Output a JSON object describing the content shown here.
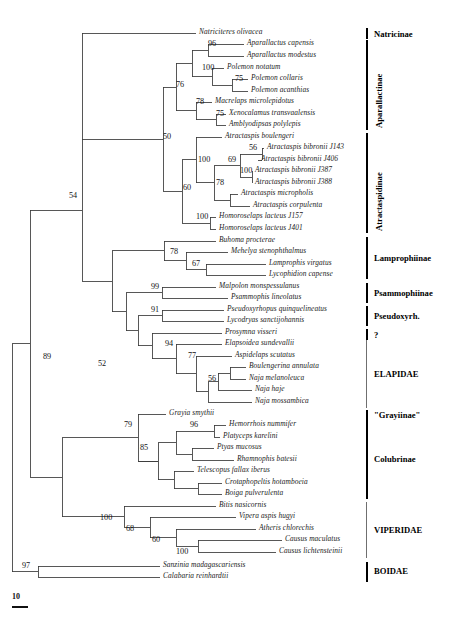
{
  "figure": {
    "line_color": "#3a3a3a",
    "label_color": "#1b1b1b"
  },
  "scale": {
    "value": "10",
    "bar_width_px": 16
  },
  "chart_data": {
    "type": "tree",
    "title": "",
    "xlabel": "",
    "ylabel": "",
    "tip_count": 45,
    "taxa": [
      {
        "id": 0,
        "label": "Natriciteres olivacea",
        "y": 33,
        "x_tip": 196,
        "clade": "Natricinae"
      },
      {
        "id": 1,
        "label": "Aparallactus capensis",
        "y": 44,
        "x_tip": 244,
        "clade": "Aparallactinae"
      },
      {
        "id": 2,
        "label": "Aparallactus modestus",
        "y": 56,
        "x_tip": 244,
        "clade": "Aparallactinae"
      },
      {
        "id": 3,
        "label": "Polemon notatum",
        "y": 68,
        "x_tip": 224,
        "clade": "Aparallactinae"
      },
      {
        "id": 4,
        "label": "Polemon collaris",
        "y": 79,
        "x_tip": 248,
        "clade": "Aparallactinae"
      },
      {
        "id": 5,
        "label": "Polemon acanthias",
        "y": 91,
        "x_tip": 248,
        "clade": "Aparallactinae"
      },
      {
        "id": 6,
        "label": "Macrelaps microlepidotus",
        "y": 102,
        "x_tip": 212,
        "clade": "Aparallactinae"
      },
      {
        "id": 7,
        "label": "Xenocalamus transvaalensis",
        "y": 114,
        "x_tip": 226,
        "clade": "Aparallactinae"
      },
      {
        "id": 8,
        "label": "Amblyodipsas polylepis",
        "y": 125,
        "x_tip": 226,
        "clade": "Aparallactinae"
      },
      {
        "id": 9,
        "label": "Atractaspis boulengeri",
        "y": 137,
        "x_tip": 222,
        "clade": "Atractaspidinae"
      },
      {
        "id": 10,
        "label": "Atractaspis bibronii J143",
        "y": 148,
        "x_tip": 264,
        "clade": "Atractaspidinae"
      },
      {
        "id": 11,
        "label": "Atractaspis bibronii J406",
        "y": 160,
        "x_tip": 258,
        "clade": "Atractaspidinae"
      },
      {
        "id": 12,
        "label": "Atractaspis bibronii J387",
        "y": 171,
        "x_tip": 252,
        "clade": "Atractaspidinae"
      },
      {
        "id": 13,
        "label": "Atractaspis bibronii J388",
        "y": 183,
        "x_tip": 252,
        "clade": "Atractaspidinae"
      },
      {
        "id": 14,
        "label": "Atractaspis micropholis",
        "y": 194,
        "x_tip": 238,
        "clade": "Atractaspidinae"
      },
      {
        "id": 15,
        "label": "Atractaspis corpulenta",
        "y": 206,
        "x_tip": 250,
        "clade": "Atractaspidinae"
      },
      {
        "id": 16,
        "label": "Homoroselaps lacteus J157",
        "y": 217,
        "x_tip": 216,
        "clade": "Atractaspidinae"
      },
      {
        "id": 17,
        "label": "Homoroselaps lacteus J401",
        "y": 229,
        "x_tip": 216,
        "clade": "Atractaspidinae"
      },
      {
        "id": 18,
        "label": "Buhoma procterae",
        "y": 241,
        "x_tip": 216,
        "clade": "Lamprophiinae"
      },
      {
        "id": 19,
        "label": "Mehelya stenophthalmus",
        "y": 252,
        "x_tip": 228,
        "clade": "Lamprophiinae"
      },
      {
        "id": 20,
        "label": "Lamprophis virgatus",
        "y": 264,
        "x_tip": 266,
        "clade": "Lamprophiinae"
      },
      {
        "id": 21,
        "label": "Lycophidion capense",
        "y": 275,
        "x_tip": 266,
        "clade": "Lamprophiinae"
      },
      {
        "id": 22,
        "label": "Malpolon monspessulanus",
        "y": 287,
        "x_tip": 216,
        "clade": "Psammophiinae"
      },
      {
        "id": 23,
        "label": "Psammophis lineolatus",
        "y": 298,
        "x_tip": 228,
        "clade": "Psammophiinae"
      },
      {
        "id": 24,
        "label": "Pseudoxyrhopus quinquelineatus",
        "y": 310,
        "x_tip": 224,
        "clade": "Pseudoxyrh."
      },
      {
        "id": 25,
        "label": "Lycodryas sanctijohannis",
        "y": 321,
        "x_tip": 224,
        "clade": "Pseudoxyrh."
      },
      {
        "id": 26,
        "label": "Prosymna visseri",
        "y": 333,
        "x_tip": 222,
        "clade": "?"
      },
      {
        "id": 27,
        "label": "Elapsoidea sundevallii",
        "y": 344,
        "x_tip": 222,
        "clade": "ELAPIDAE"
      },
      {
        "id": 28,
        "label": "Aspidelaps scutatus",
        "y": 356,
        "x_tip": 232,
        "clade": "ELAPIDAE"
      },
      {
        "id": 29,
        "label": "Boulengerina annulata",
        "y": 367,
        "x_tip": 246,
        "clade": "ELAPIDAE"
      },
      {
        "id": 30,
        "label": "Naja melanoleuca",
        "y": 379,
        "x_tip": 246,
        "clade": "ELAPIDAE"
      },
      {
        "id": 31,
        "label": "Naja haje",
        "y": 390,
        "x_tip": 252,
        "clade": "ELAPIDAE"
      },
      {
        "id": 32,
        "label": "Naja mossambica",
        "y": 402,
        "x_tip": 252,
        "clade": "ELAPIDAE"
      },
      {
        "id": 33,
        "label": "Grayia smythii",
        "y": 414,
        "x_tip": 166,
        "clade": "\"Grayiinae\""
      },
      {
        "id": 34,
        "label": "Hemorrhois nummifer",
        "y": 425,
        "x_tip": 226,
        "clade": "Colubrinae"
      },
      {
        "id": 35,
        "label": "Platyceps karelini",
        "y": 437,
        "x_tip": 220,
        "clade": "Colubrinae"
      },
      {
        "id": 36,
        "label": "Ptyas mucosus",
        "y": 448,
        "x_tip": 214,
        "clade": "Colubrinae"
      },
      {
        "id": 37,
        "label": "Rhamnophis batesii",
        "y": 460,
        "x_tip": 234,
        "clade": "Colubrinae"
      },
      {
        "id": 38,
        "label": "Telescopus fallax iberus",
        "y": 471,
        "x_tip": 194,
        "clade": "Colubrinae"
      },
      {
        "id": 39,
        "label": "Crotaphopeltis hotamboeia",
        "y": 483,
        "x_tip": 222,
        "clade": "Colubrinae"
      },
      {
        "id": 40,
        "label": "Boiga pulverulenta",
        "y": 494,
        "x_tip": 222,
        "clade": "Colubrinae"
      },
      {
        "id": 41,
        "label": "Bitis nasicornis",
        "y": 506,
        "x_tip": 216,
        "clade": "VIPERIDAE"
      },
      {
        "id": 42,
        "label": "Vipera aspis hugyi",
        "y": 517,
        "x_tip": 236,
        "clade": "VIPERIDAE"
      },
      {
        "id": 43,
        "label": "Atheris chlorechis",
        "y": 529,
        "x_tip": 256,
        "clade": "VIPERIDAE"
      },
      {
        "id": 44,
        "label": "Causus maculatus",
        "y": 540,
        "x_tip": 282,
        "clade": "VIPERIDAE"
      },
      {
        "id": 45,
        "label": "Causus lichtensteinii",
        "y": 552,
        "x_tip": 276,
        "clade": "VIPERIDAE"
      },
      {
        "id": 46,
        "label": "Sanzinia madagascariensis",
        "y": 566,
        "x_tip": 160,
        "clade": "BOIDAE"
      },
      {
        "id": 47,
        "label": "Calabaria reinhardtii",
        "y": 577,
        "x_tip": 160,
        "clade": "BOIDAE"
      }
    ],
    "support_values": [
      {
        "value": "96",
        "x": 208,
        "y": 40
      },
      {
        "value": "100",
        "x": 202,
        "y": 64
      },
      {
        "value": "75",
        "x": 235,
        "y": 75
      },
      {
        "value": "76",
        "x": 176,
        "y": 81
      },
      {
        "value": "78",
        "x": 196,
        "y": 98
      },
      {
        "value": "75",
        "x": 216,
        "y": 110
      },
      {
        "value": "50",
        "x": 163,
        "y": 133
      },
      {
        "value": "56",
        "x": 249,
        "y": 144
      },
      {
        "value": "100",
        "x": 198,
        "y": 156
      },
      {
        "value": "69",
        "x": 228,
        "y": 156
      },
      {
        "value": "100",
        "x": 240,
        "y": 167
      },
      {
        "value": "78",
        "x": 216,
        "y": 179
      },
      {
        "value": "60",
        "x": 183,
        "y": 184
      },
      {
        "value": "100",
        "x": 196,
        "y": 213
      },
      {
        "value": "54",
        "x": 69,
        "y": 192
      },
      {
        "value": "78",
        "x": 170,
        "y": 248
      },
      {
        "value": "67",
        "x": 192,
        "y": 260
      },
      {
        "value": "99",
        "x": 151,
        "y": 283
      },
      {
        "value": "91",
        "x": 151,
        "y": 306
      },
      {
        "value": "89",
        "x": 43,
        "y": 353
      },
      {
        "value": "52",
        "x": 98,
        "y": 360
      },
      {
        "value": "94",
        "x": 165,
        "y": 340
      },
      {
        "value": "77",
        "x": 188,
        "y": 352
      },
      {
        "value": "56",
        "x": 208,
        "y": 375
      },
      {
        "value": "79",
        "x": 124,
        "y": 421
      },
      {
        "value": "96",
        "x": 190,
        "y": 421
      },
      {
        "value": "85",
        "x": 140,
        "y": 444
      },
      {
        "value": "100",
        "x": 100,
        "y": 514
      },
      {
        "value": "68",
        "x": 126,
        "y": 525
      },
      {
        "value": "60",
        "x": 152,
        "y": 536
      },
      {
        "value": "100",
        "x": 176,
        "y": 548
      },
      {
        "value": "97",
        "x": 22,
        "y": 562
      }
    ],
    "clade_bars": [
      {
        "label": "Natricinae",
        "top": 28,
        "height": 11,
        "orientation": "horizontal",
        "text_x": 374,
        "text_y": 29,
        "weight": "thick"
      },
      {
        "label": "Aparallactinae",
        "top": 40,
        "height": 90,
        "orientation": "vertical",
        "text_x": 374,
        "text_y": 128,
        "weight": "thick"
      },
      {
        "label": "Atractaspidinae",
        "top": 133,
        "height": 100,
        "orientation": "vertical",
        "text_x": 374,
        "text_y": 231,
        "weight": "thick"
      },
      {
        "label": "Lamprophiinae",
        "top": 237,
        "height": 42,
        "orientation": "horizontal",
        "text_x": 374,
        "text_y": 253,
        "weight": "thick"
      },
      {
        "label": "Psammophiinae",
        "top": 283,
        "height": 20,
        "orientation": "horizontal",
        "text_x": 374,
        "text_y": 288,
        "weight": "thick"
      },
      {
        "label": "Pseudoxyrh.",
        "top": 306,
        "height": 20,
        "orientation": "horizontal",
        "text_x": 374,
        "text_y": 311,
        "weight": "thick"
      },
      {
        "label": "?",
        "top": 329,
        "height": 11,
        "orientation": "horizontal",
        "text_x": 374,
        "text_y": 330,
        "weight": "thick"
      },
      {
        "label": "ELAPIDAE",
        "top": 340,
        "height": 68,
        "orientation": "horizontal",
        "text_x": 374,
        "text_y": 369,
        "weight": "thin"
      },
      {
        "label": "\"Grayiinae\"",
        "top": 410,
        "height": 11,
        "orientation": "horizontal",
        "text_x": 374,
        "text_y": 410,
        "weight": "thick"
      },
      {
        "label": "Colubrinae",
        "top": 421,
        "height": 78,
        "orientation": "horizontal",
        "text_x": 374,
        "text_y": 454,
        "weight": "thick"
      },
      {
        "label": "VIPERIDAE",
        "top": 502,
        "height": 56,
        "orientation": "horizontal",
        "text_x": 374,
        "text_y": 525,
        "weight": "thin"
      },
      {
        "label": "BOIDAE",
        "top": 562,
        "height": 20,
        "orientation": "horizontal",
        "text_x": 374,
        "text_y": 566,
        "weight": "thick"
      }
    ]
  }
}
